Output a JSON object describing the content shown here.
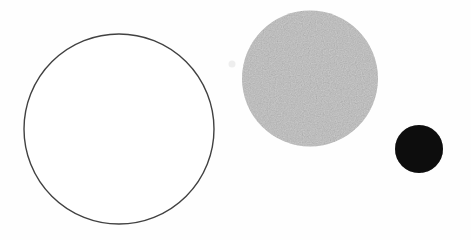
{
  "canvas": {
    "width": 471,
    "height": 240,
    "background": "#fefefe"
  },
  "shapes": {
    "outlined_circle": {
      "cx": 119,
      "cy": 129,
      "r": 95,
      "fill": "#ffffff",
      "stroke": "#414141",
      "stroke_width": 1.4
    },
    "gray_circle": {
      "cx": 310,
      "cy": 78.5,
      "r": 68,
      "fill": "#d9d9d9",
      "stroke": "none",
      "stroke_width": 0
    },
    "black_circle": {
      "cx": 419,
      "cy": 149,
      "r": 24,
      "fill": "#181818",
      "stroke": "none",
      "stroke_width": 0
    },
    "scan_speck": {
      "cx": 232,
      "cy": 64,
      "r": 3.5,
      "fill": "#eeeeee",
      "stroke": "none",
      "stroke_width": 0
    }
  }
}
